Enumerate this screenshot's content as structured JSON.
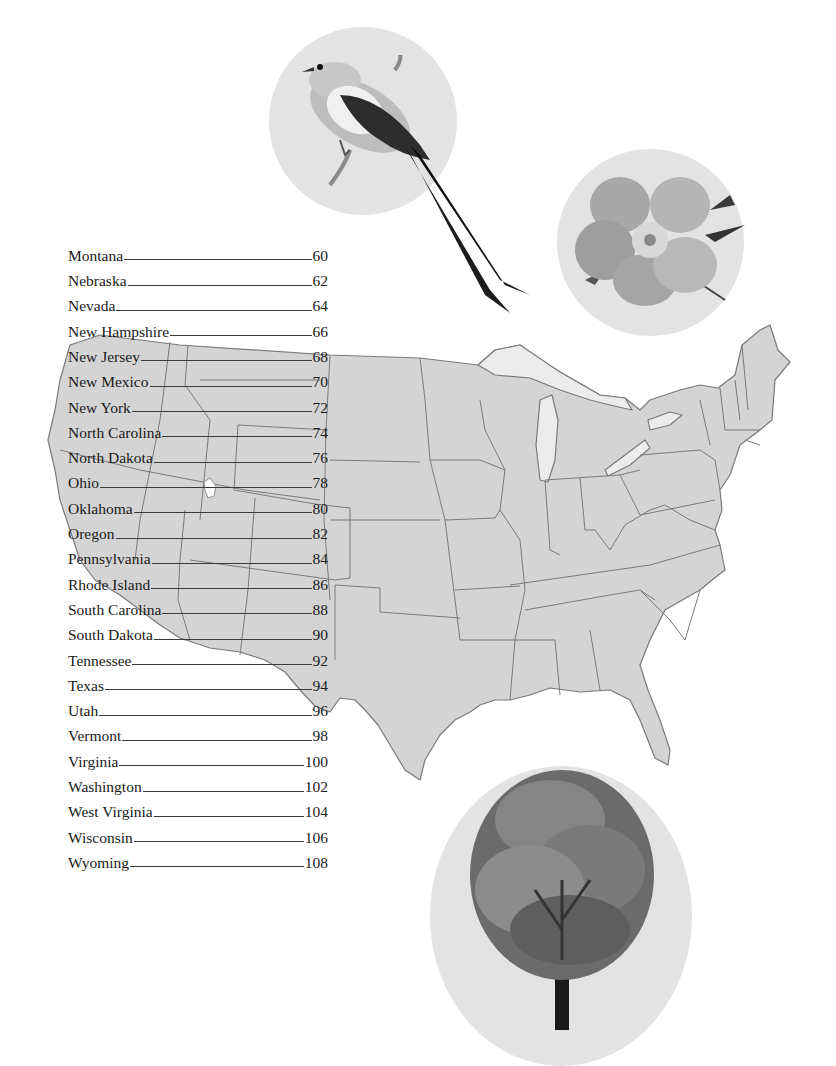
{
  "contents": {
    "entries": [
      {
        "state": "Montana",
        "page": "60"
      },
      {
        "state": "Nebraska",
        "page": "62"
      },
      {
        "state": "Nevada",
        "page": "64"
      },
      {
        "state": "New Hampshire",
        "page": "66"
      },
      {
        "state": "New Jersey",
        "page": "68"
      },
      {
        "state": "New Mexico",
        "page": "70"
      },
      {
        "state": "New York",
        "page": "72"
      },
      {
        "state": "North Carolina",
        "page": "74"
      },
      {
        "state": "North Dakota",
        "page": "76"
      },
      {
        "state": "Ohio",
        "page": "78"
      },
      {
        "state": "Oklahoma",
        "page": "80"
      },
      {
        "state": "Oregon",
        "page": "82"
      },
      {
        "state": "Pennsylvania",
        "page": "84"
      },
      {
        "state": "Rhode Island",
        "page": "86"
      },
      {
        "state": "South Carolina",
        "page": "88"
      },
      {
        "state": "South Dakota",
        "page": "90"
      },
      {
        "state": "Tennessee",
        "page": "92"
      },
      {
        "state": "Texas",
        "page": "94"
      },
      {
        "state": "Utah",
        "page": "96"
      },
      {
        "state": "Vermont",
        "page": "98"
      },
      {
        "state": "Virginia",
        "page": "100"
      },
      {
        "state": "Washington",
        "page": "102"
      },
      {
        "state": "West Virginia",
        "page": "104"
      },
      {
        "state": "Wisconsin",
        "page": "106"
      },
      {
        "state": "Wyoming",
        "page": "108"
      }
    ]
  },
  "illustrations": {
    "bird": "scissor-tailed flycatcher illustration",
    "flower": "wild rose illustration",
    "tree": "deciduous tree illustration",
    "map": "United States outline map"
  },
  "colors": {
    "map_fill": "#d4d4d4",
    "map_border": "#7a7a7a",
    "circle_bg": "#e3e3e3",
    "text": "#1a1a1a"
  }
}
